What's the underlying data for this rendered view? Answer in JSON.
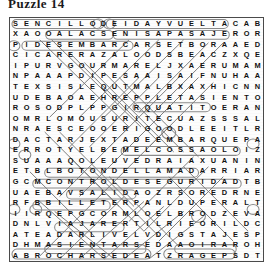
{
  "title": "Puzzle 14",
  "puzzle": {
    "type": "word-search",
    "language": "Spanish",
    "rows": 23,
    "cols": 23,
    "grid": [
      "SENCILLODEIDAYVUELTACAB",
      "XAOOALACSENISAPASAJEROR",
      "PIDESEMBARCARSETBORAAED",
      "CICARERAZALOODSBEACZXQE",
      "IPURVGOURMARELJXAERUMAM",
      "NPAAAPDIPESAAISAIFNUHAA",
      "TEXSISLEQUTMALBXAXHICNN",
      "UDEBAOAEHREPPLETASIENTO",
      "ROSODPLPPGIRQUATITOERAN",
      "OMRLOMOUSURITECUAZSSSAL",
      "NRAESCEOOERIGOODLEEITLR",
      "DACTARJEXTADEEMBARQUEPA",
      "ERROTYELBEMELCOSSAOLOIZ",
      "SUAAAQOLEUVEDRAIAXUANIN",
      "ETBLBOTONDELLAMADARRIAR",
      "GCMCONTROLDESEGURIDADTB",
      "UAEBAVSALIDAOZRSOREDRNE",
      "RFBBILLETERPANLDUPERALT",
      "IIRQEPGCORMLOELBRODZEVA",
      "DNLVIAJARERTILRIEORILDC",
      "ATEADARLIVELVDIGSTAJESP",
      "DHMASIENTARSEDAAOIRAROH",
      "ABROCHARSEDEATZRAGEPSDT"
    ],
    "found_words": [
      "SENCILLO",
      "DE IDA Y VUELTA",
      "ALACSENISA",
      "PASAJERO",
      "DESEMBARCAR",
      "ASIENTO",
      "DEEMBARQUE",
      "BOTON DE LLAMADA",
      "CONTROL DE SEGURIDAD",
      "SALIDA",
      "BILLETE",
      "VIAJAR",
      "ASIENTARSE",
      "ABROCHARSE"
    ]
  },
  "colors": {
    "letter": "#111111",
    "ring": "#8a8a8a",
    "slash": "#7c7c7c",
    "frame": "#4a4a4a",
    "background": "#ffffff"
  }
}
